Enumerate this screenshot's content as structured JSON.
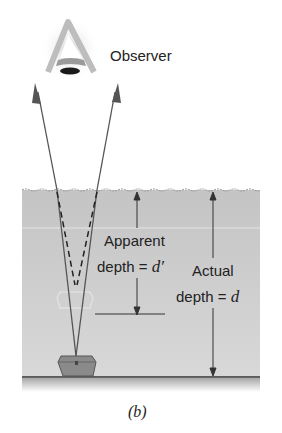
{
  "figure": {
    "caption": "(b)",
    "observer_label": "Observer",
    "apparent_depth": {
      "line1": "Apparent",
      "line2_prefix": "depth = ",
      "symbol": "d′"
    },
    "actual_depth": {
      "line1": "Actual",
      "line2_prefix": "depth = ",
      "symbol": "d"
    },
    "elements": [
      "observer-eye",
      "light-rays",
      "dashed-extension-lines",
      "water",
      "treasure-chest",
      "apparent-image",
      "sea-floor"
    ],
    "colors": {
      "water": "#c9c9c9",
      "ray": "#555555",
      "chest": "#8a8a8a",
      "floor": "#333333"
    }
  }
}
